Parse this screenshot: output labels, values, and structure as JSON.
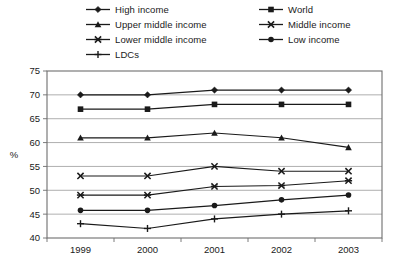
{
  "chart_data": {
    "type": "line",
    "title": "",
    "xlabel": "",
    "ylabel": "%",
    "categories": [
      "1999",
      "2000",
      "2001",
      "2002",
      "2003"
    ],
    "x": [
      1999,
      2000,
      2001,
      2002,
      2003
    ],
    "ylim": [
      40,
      75
    ],
    "ytick_values": [
      40,
      45,
      50,
      55,
      60,
      65,
      70,
      75
    ],
    "ytick_labels": [
      "40",
      "45",
      "50",
      "55",
      "60",
      "65",
      "70",
      "75"
    ],
    "grid": true,
    "legend_position": "top",
    "series": [
      {
        "name": "High income",
        "marker": "diamond",
        "values": [
          70.0,
          70.0,
          71.0,
          71.0,
          71.0
        ]
      },
      {
        "name": "World",
        "marker": "square",
        "values": [
          67.0,
          67.0,
          68.0,
          68.0,
          68.0
        ]
      },
      {
        "name": "Upper middle income",
        "marker": "triangle",
        "values": [
          61.0,
          61.0,
          62.0,
          61.0,
          59.0
        ]
      },
      {
        "name": "Middle income",
        "marker": "x",
        "values": [
          53.0,
          53.0,
          55.0,
          54.0,
          54.0
        ]
      },
      {
        "name": "Lower middle income",
        "marker": "star",
        "values": [
          49.0,
          49.0,
          50.8,
          51.0,
          52.0
        ]
      },
      {
        "name": "Low income",
        "marker": "circle",
        "values": [
          45.8,
          45.8,
          46.8,
          48.0,
          49.0
        ]
      },
      {
        "name": "LDCs",
        "marker": "plus",
        "values": [
          43.0,
          42.0,
          44.0,
          45.0,
          45.7
        ]
      }
    ],
    "colors": {
      "line": "#1a1a1a",
      "grid": "#9a9a9a",
      "frame": "#6e6e6e",
      "background": "#ffffff"
    }
  },
  "legend": {
    "items": [
      {
        "label": "High income",
        "marker": "diamond",
        "col": 0,
        "row": 0
      },
      {
        "label": "World",
        "marker": "square",
        "col": 1,
        "row": 0
      },
      {
        "label": "Upper middle income",
        "marker": "triangle",
        "col": 0,
        "row": 1
      },
      {
        "label": "Middle income",
        "marker": "x",
        "col": 1,
        "row": 1
      },
      {
        "label": "Lower middle income",
        "marker": "star",
        "col": 0,
        "row": 2
      },
      {
        "label": "Low income",
        "marker": "circle",
        "col": 1,
        "row": 2
      },
      {
        "label": "LDCs",
        "marker": "plus",
        "col": 0,
        "row": 3
      }
    ]
  }
}
